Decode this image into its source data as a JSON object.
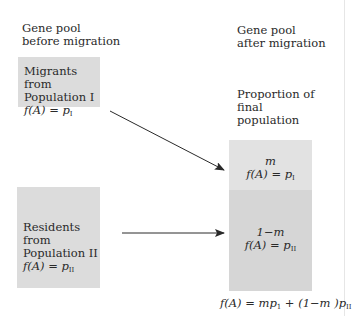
{
  "headers": {
    "before": [
      "Gene pool",
      "before migration"
    ],
    "after": [
      "Gene pool",
      "after migration"
    ],
    "proportion": [
      "Proportion of",
      "final",
      "population"
    ]
  },
  "source_boxes": [
    {
      "lines": [
        "Migrants from",
        "Population I"
      ],
      "formula_lhs": "f(A) = ",
      "formula_var": "p",
      "formula_sub": "I"
    },
    {
      "lines": [
        "Residents from",
        "Population II"
      ],
      "formula_lhs": "f(A) = ",
      "formula_var": "p",
      "formula_sub": "II"
    }
  ],
  "result_box": {
    "top": {
      "proportion": "m",
      "formula_lhs": "f(A) = ",
      "formula_var": "p",
      "formula_sub": "I"
    },
    "bottom": {
      "proportion": "1−m",
      "formula_lhs": "f(A) = ",
      "formula_var": "p",
      "formula_sub": "II"
    }
  },
  "final_formula": {
    "lhs": "f(A) = mp",
    "sub1": "1",
    "mid": " + (1−m )p",
    "sub2": "II"
  },
  "colors": {
    "source_box": "#dcdcdc",
    "result_top": "#e2e2e2",
    "result_bottom": "#d6d6d6",
    "arrow": "#2a2a2a"
  }
}
